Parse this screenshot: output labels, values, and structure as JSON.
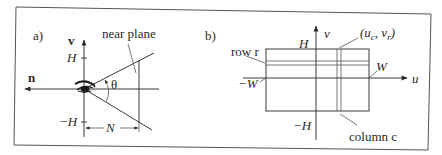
{
  "figure": {
    "frame_color": "#555555",
    "line_color": "#3a3a3a",
    "panel_a": {
      "label": "a)",
      "n_axis_label": "n",
      "v_axis_label": "v",
      "top_tick": "H",
      "bottom_tick": "−H",
      "angle_label": "θ",
      "near_plane_label": "near plane",
      "distance_label": "N"
    },
    "panel_b": {
      "label": "b)",
      "v_axis_label": "v",
      "u_axis_label": "u",
      "top_label": "H",
      "bottom_label": "−H",
      "left_label": "−W",
      "right_label": "W",
      "row_label": "row r",
      "column_label": "column c",
      "point_label": "(uᴄ, vᵣ)",
      "point_label_u": "(u",
      "point_label_c": "c",
      "point_label_v": ", v",
      "point_label_r": "r",
      "point_label_close": ")"
    }
  }
}
